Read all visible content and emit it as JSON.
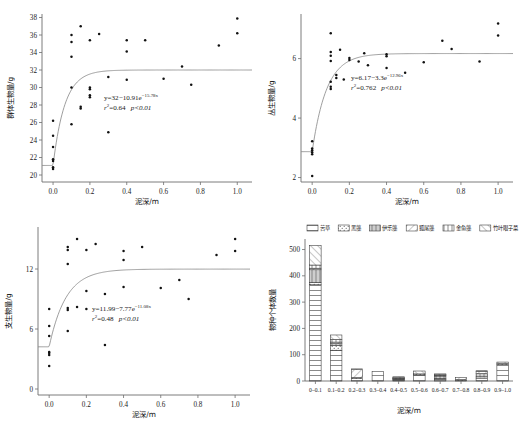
{
  "figure": {
    "panels": [
      "a",
      "b",
      "c",
      "d"
    ]
  },
  "common": {
    "xlabel": "泥深/m",
    "xticks": [
      "0.0",
      "0.2",
      "0.4",
      "0.6",
      "0.8",
      "1.0"
    ],
    "xlim": [
      -0.06,
      1.08
    ]
  },
  "chart_data": [
    {
      "type": "scatter",
      "id": "panel-a",
      "title": "",
      "xlabel": "泥深/m",
      "ylabel": "群体生物量/g",
      "xlim": [
        -0.06,
        1.08
      ],
      "ylim": [
        19.2,
        38.4
      ],
      "xticks": [
        "0.0",
        "0.2",
        "0.4",
        "0.6",
        "0.8",
        "1.0"
      ],
      "yticks": [
        "20",
        "22",
        "24",
        "26",
        "28",
        "30",
        "32",
        "34",
        "36",
        "38"
      ],
      "grid": false,
      "annotation_eq": "y=32−10.91e",
      "annotation_exp": "−15.78x",
      "annotation_stats_r": "r",
      "annotation_stats_rest": "=0.64",
      "annotation_p": "p<0.01",
      "fit": {
        "a": 32,
        "b": 10.91,
        "k": 15.78
      },
      "points": [
        [
          0.0,
          20.7
        ],
        [
          0.0,
          20.9
        ],
        [
          0.0,
          21.6
        ],
        [
          0.0,
          21.8
        ],
        [
          0.0,
          23.2
        ],
        [
          0.0,
          24.5
        ],
        [
          0.0,
          26.2
        ],
        [
          0.1,
          30.0
        ],
        [
          0.1,
          25.8
        ],
        [
          0.1,
          33.5
        ],
        [
          0.1,
          35.2
        ],
        [
          0.1,
          36.0
        ],
        [
          0.15,
          27.6
        ],
        [
          0.15,
          27.8
        ],
        [
          0.15,
          37.0
        ],
        [
          0.2,
          28.9
        ],
        [
          0.2,
          29.1
        ],
        [
          0.2,
          29.8
        ],
        [
          0.2,
          30.0
        ],
        [
          0.2,
          35.4
        ],
        [
          0.25,
          36.1
        ],
        [
          0.3,
          24.9
        ],
        [
          0.3,
          31.2
        ],
        [
          0.4,
          30.9
        ],
        [
          0.4,
          34.1
        ],
        [
          0.4,
          35.4
        ],
        [
          0.5,
          35.4
        ],
        [
          0.6,
          31.0
        ],
        [
          0.7,
          32.4
        ],
        [
          0.75,
          30.3
        ],
        [
          0.9,
          34.8
        ],
        [
          1.0,
          36.2
        ],
        [
          1.0,
          37.9
        ]
      ]
    },
    {
      "type": "scatter",
      "id": "panel-b",
      "title": "",
      "xlabel": "泥深/m",
      "ylabel": "丛生物量/g",
      "xlim": [
        -0.06,
        1.08
      ],
      "ylim": [
        1.85,
        7.5
      ],
      "xticks": [
        "0.0",
        "0.2",
        "0.4",
        "0.6",
        "0.8",
        "1.0"
      ],
      "yticks": [
        "2",
        "4",
        "6"
      ],
      "grid": false,
      "annotation_eq": "y=6.17−3.3e",
      "annotation_exp": "−12.96x",
      "annotation_stats_r": "r",
      "annotation_stats_rest": "=0.762",
      "annotation_p": "p<0.01",
      "fit": {
        "a": 6.17,
        "b": 3.3,
        "k": 12.96
      },
      "points": [
        [
          0.0,
          2.05
        ],
        [
          0.0,
          2.78
        ],
        [
          0.0,
          2.85
        ],
        [
          0.0,
          2.92
        ],
        [
          0.0,
          2.98
        ],
        [
          0.0,
          3.22
        ],
        [
          0.1,
          4.98
        ],
        [
          0.1,
          5.05
        ],
        [
          0.1,
          5.22
        ],
        [
          0.1,
          5.92
        ],
        [
          0.1,
          6.1
        ],
        [
          0.1,
          6.22
        ],
        [
          0.1,
          6.85
        ],
        [
          0.13,
          5.35
        ],
        [
          0.13,
          5.45
        ],
        [
          0.15,
          6.3
        ],
        [
          0.17,
          5.3
        ],
        [
          0.2,
          5.95
        ],
        [
          0.2,
          6.02
        ],
        [
          0.25,
          5.9
        ],
        [
          0.28,
          6.18
        ],
        [
          0.3,
          5.78
        ],
        [
          0.4,
          5.68
        ],
        [
          0.4,
          6.08
        ],
        [
          0.4,
          6.15
        ],
        [
          0.5,
          5.52
        ],
        [
          0.6,
          5.88
        ],
        [
          0.7,
          6.6
        ],
        [
          0.75,
          6.32
        ],
        [
          0.9,
          5.9
        ],
        [
          1.0,
          6.78
        ],
        [
          1.0,
          7.18
        ]
      ]
    },
    {
      "type": "scatter",
      "id": "panel-c",
      "title": "",
      "xlabel": "泥深/m",
      "ylabel": "支生物量/g",
      "xlim": [
        -0.06,
        1.08
      ],
      "ylim": [
        -0.6,
        16.2
      ],
      "xticks": [
        "0.0",
        "0.2",
        "0.4",
        "0.6",
        "0.8",
        "1.0"
      ],
      "yticks": [
        "0",
        "6",
        "12"
      ],
      "grid": false,
      "annotation_eq": "y=11.99−7.77e",
      "annotation_exp": "−11.08x",
      "annotation_stats_r": "r",
      "annotation_stats_rest": "=0.48",
      "annotation_p": "p<0.01",
      "fit": {
        "a": 11.99,
        "b": 7.77,
        "k": 11.08
      },
      "points": [
        [
          0.0,
          2.3
        ],
        [
          0.0,
          3.4
        ],
        [
          0.0,
          3.6
        ],
        [
          0.0,
          3.7
        ],
        [
          0.0,
          5.3
        ],
        [
          0.0,
          6.3
        ],
        [
          0.0,
          8.0
        ],
        [
          0.1,
          5.8
        ],
        [
          0.1,
          7.9
        ],
        [
          0.1,
          8.1
        ],
        [
          0.1,
          12.5
        ],
        [
          0.1,
          13.9
        ],
        [
          0.1,
          14.2
        ],
        [
          0.15,
          8.2
        ],
        [
          0.15,
          15.0
        ],
        [
          0.2,
          8.0
        ],
        [
          0.2,
          9.8
        ],
        [
          0.2,
          13.9
        ],
        [
          0.25,
          14.5
        ],
        [
          0.3,
          4.4
        ],
        [
          0.3,
          9.5
        ],
        [
          0.4,
          10.2
        ],
        [
          0.4,
          12.9
        ],
        [
          0.4,
          13.8
        ],
        [
          0.5,
          14.2
        ],
        [
          0.6,
          10.1
        ],
        [
          0.7,
          10.9
        ],
        [
          0.75,
          9.0
        ],
        [
          0.9,
          13.4
        ],
        [
          1.0,
          13.8
        ],
        [
          1.0,
          15.0
        ]
      ]
    },
    {
      "type": "bar",
      "id": "panel-d",
      "subtype": "stacked",
      "title": "",
      "xlabel": "泥深/m",
      "ylabel": "物种个体数量",
      "ylim": [
        0,
        540
      ],
      "yticks": [
        "0",
        "100",
        "200",
        "300",
        "400",
        "500"
      ],
      "grid": false,
      "legend_position": "top",
      "categories": [
        "0–0.1",
        "0.1–0.2",
        "0.2–0.3",
        "0.3–0.4",
        "0.4–0.5",
        "0.5–0.6",
        "0.6–0.7",
        "0.7–0.8",
        "0.8–0.9",
        "0.9–1.0"
      ],
      "series": [
        {
          "name": "苦草",
          "values": [
            366,
            117,
            9,
            36,
            4,
            23,
            6,
            3,
            11,
            62
          ]
        },
        {
          "name": "黑藻",
          "values": [
            9,
            18,
            4,
            0,
            3,
            4,
            4,
            2,
            5,
            4
          ]
        },
        {
          "name": "伊乐藻",
          "values": [
            48,
            7,
            0,
            0,
            2,
            0,
            9,
            0,
            12,
            0
          ]
        },
        {
          "name": "狐尾藻",
          "values": [
            6,
            6,
            31,
            0,
            2,
            0,
            3,
            8,
            9,
            0
          ]
        },
        {
          "name": "金鱼藻",
          "values": [
            12,
            10,
            0,
            0,
            2,
            0,
            3,
            0,
            0,
            0
          ]
        },
        {
          "name": "竹叶眼子菜",
          "values": [
            74,
            17,
            2,
            0,
            3,
            11,
            2,
            0,
            2,
            6
          ]
        }
      ]
    }
  ]
}
